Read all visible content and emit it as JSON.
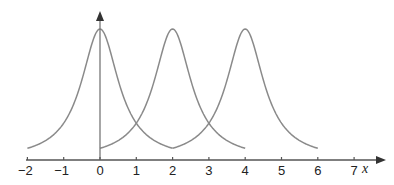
{
  "chart_data": {
    "type": "line",
    "title": "",
    "xlabel": "x",
    "ylabel": "",
    "xlim": [
      -2,
      7.3
    ],
    "ylim": [
      0,
      1.1
    ],
    "grid": false,
    "legend": null,
    "x_ticks": [
      -2,
      -1,
      0,
      1,
      2,
      3,
      4,
      5,
      6,
      7
    ],
    "x_tick_labels": [
      "−2",
      "−1",
      "0",
      "1",
      "2",
      "3",
      "4",
      "5",
      "6",
      "7"
    ],
    "series": [
      {
        "name": "curve-centered-0",
        "center": 0,
        "domain": [
          -2,
          2
        ],
        "peak": 1.0,
        "shape": "bell",
        "color": "#8a8a8a"
      },
      {
        "name": "curve-centered-2",
        "center": 2,
        "domain": [
          0,
          4
        ],
        "peak": 1.0,
        "shape": "bell",
        "color": "#8a8a8a"
      },
      {
        "name": "curve-centered-4",
        "center": 4,
        "domain": [
          2,
          6
        ],
        "peak": 1.0,
        "shape": "bell",
        "color": "#8a8a8a"
      }
    ],
    "annotations": []
  },
  "style": {
    "axis_color": "#555555",
    "curve_color": "#8a8a8a"
  }
}
